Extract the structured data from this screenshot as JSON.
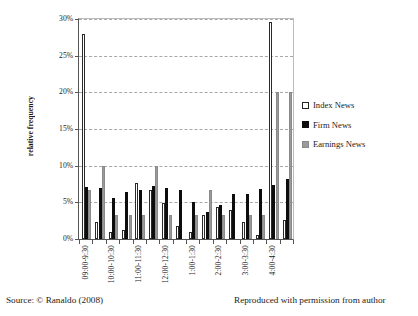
{
  "figure": {
    "yaxis_title": "relative frequency"
  },
  "legend": {
    "position": "right",
    "items": [
      {
        "label": "Index News",
        "key": "index",
        "color": "#ffffff"
      },
      {
        "label": "Firm News",
        "key": "firm",
        "color": "#0d0d0d"
      },
      {
        "label": "Earnings News",
        "key": "earn",
        "color": "#9a9a9a"
      }
    ]
  },
  "footer": {
    "source": "Source: © Ranaldo (2008)",
    "permission": "Reproduced with permission from author"
  },
  "chart_data": {
    "type": "bar",
    "title": "",
    "subtitle": "",
    "xlabel": "",
    "ylabel": "relative frequency",
    "ylim": [
      0,
      30
    ],
    "yticks": [
      0,
      5,
      10,
      15,
      20,
      25,
      30
    ],
    "ytick_labels": [
      "0%",
      "5%",
      "10%",
      "15%",
      "20%",
      "25%",
      "30%"
    ],
    "grid": true,
    "grid_axis": "y",
    "legend_position": "right",
    "value_unit": "percent",
    "categories": [
      "09:00-9:30",
      "9:30-10:00",
      "10:00-10:30",
      "10:30-11:00",
      "11:00-11:30",
      "11:30-12:00",
      "12:00-12:30",
      "12:30-1:00",
      "1:00-1:30",
      "1:30-2:00",
      "2:00-2:30",
      "2:30-3:00",
      "3:00-3:30",
      "3:30-4:00",
      "4:00-4:30",
      "4:30-5:00"
    ],
    "visible_tick_labels": [
      "09:00-9:30",
      "10:00-10:30",
      "11:00-11:30",
      "12:00-12:30",
      "1:00-1:30",
      "2:00-2:30",
      "3:00-3:30",
      "4:00-4:30"
    ],
    "visible_tick_indices": [
      0,
      2,
      4,
      6,
      8,
      10,
      12,
      14
    ],
    "series": [
      {
        "name": "Index News",
        "color": "#ffffff",
        "values": [
          28.0,
          2.3,
          0.9,
          1.2,
          7.7,
          6.7,
          4.9,
          1.8,
          1.0,
          3.3,
          4.4,
          3.9,
          2.3,
          0.6,
          29.6,
          2.6
        ]
      },
      {
        "name": "Firm News",
        "color": "#0d0d0d",
        "values": [
          7.1,
          7.0,
          5.6,
          6.4,
          6.7,
          7.2,
          7.0,
          6.7,
          5.1,
          3.7,
          4.7,
          6.1,
          6.1,
          6.8,
          7.4,
          8.2
        ]
      },
      {
        "name": "Earnings News",
        "color": "#9a9a9a",
        "values": [
          6.7,
          10.0,
          3.3,
          3.3,
          3.3,
          10.0,
          3.3,
          0.0,
          3.3,
          6.7,
          3.3,
          0.0,
          3.3,
          3.3,
          20.1,
          20.1
        ]
      }
    ]
  }
}
